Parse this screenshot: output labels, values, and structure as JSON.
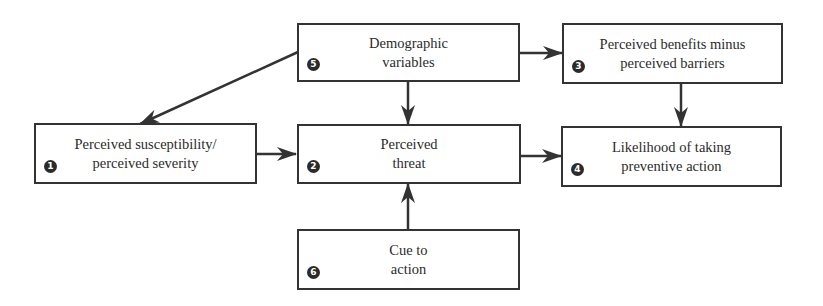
{
  "diagram": {
    "nodes": [
      {
        "id": "susceptibility",
        "number": "1",
        "label": "Perceived susceptibility/\nperceived severity"
      },
      {
        "id": "threat",
        "number": "2",
        "label": "Perceived\nthreat"
      },
      {
        "id": "benefits",
        "number": "3",
        "label": "Perceived benefits minus\nperceived barriers"
      },
      {
        "id": "likelihood",
        "number": "4",
        "label": "Likelihood of taking\npreventive action"
      },
      {
        "id": "demographic",
        "number": "5",
        "label": "Demographic\nvariables"
      },
      {
        "id": "cue",
        "number": "6",
        "label": "Cue to\naction"
      }
    ],
    "edges": [
      {
        "from": "demographic",
        "to": "susceptibility"
      },
      {
        "from": "demographic",
        "to": "threat"
      },
      {
        "from": "demographic",
        "to": "benefits"
      },
      {
        "from": "benefits",
        "to": "likelihood"
      },
      {
        "from": "susceptibility",
        "to": "threat"
      },
      {
        "from": "threat",
        "to": "likelihood"
      },
      {
        "from": "cue",
        "to": "threat"
      }
    ],
    "colors": {
      "line": "#333333",
      "text": "#2b2b2b",
      "badge": "#2b2b2b",
      "background": "#ffffff"
    }
  }
}
